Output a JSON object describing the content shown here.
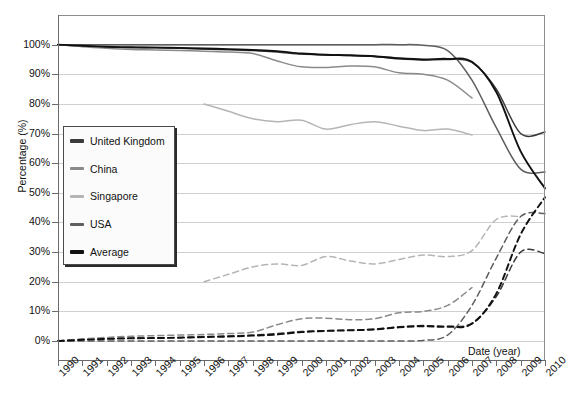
{
  "chart_title_cut_off": "",
  "axes": {
    "ylabel": "Percentage (%)",
    "xlabel": "Date (year)",
    "yticks": [
      "0%",
      "10%",
      "20%",
      "30%",
      "40%",
      "50%",
      "60%",
      "70%",
      "80%",
      "90%",
      "100%"
    ],
    "xticks": [
      "1990",
      "1991",
      "1992",
      "1993",
      "1994",
      "1995",
      "1996",
      "1997",
      "1998",
      "1999",
      "2000",
      "2001",
      "2002",
      "2003",
      "2004",
      "2005",
      "2006",
      "2007",
      "2008",
      "2009",
      "2010"
    ]
  },
  "legend": {
    "items": [
      {
        "label": "United Kingdom",
        "color": "#3a3a3a"
      },
      {
        "label": "China",
        "color": "#8a8a8a"
      },
      {
        "label": "Singapore",
        "color": "#b5b5b5"
      },
      {
        "label": "USA",
        "color": "#5e5e5e"
      },
      {
        "label": "Average",
        "color": "#111111"
      }
    ]
  },
  "chart_data": {
    "type": "line",
    "title": "",
    "xlabel": "Date (year)",
    "ylabel": "Percentage (%)",
    "xlim": [
      1990,
      2010
    ],
    "ylim": [
      0,
      110
    ],
    "grid": true,
    "legend_position": "inside-left",
    "x": [
      1990,
      1991,
      1992,
      1993,
      1994,
      1995,
      1996,
      1997,
      1998,
      1999,
      2000,
      2001,
      2002,
      2003,
      2004,
      2005,
      2006,
      2007,
      2008,
      2009,
      2010
    ],
    "series": [
      {
        "name": "United Kingdom",
        "style": "solid",
        "color": "#3a3a3a",
        "values": [
          100,
          99.5,
          99.2,
          99.0,
          99.0,
          98.8,
          98.5,
          98.3,
          98.0,
          97.5,
          96.8,
          96.5,
          96.3,
          96.0,
          95.2,
          94.8,
          95.0,
          94.0,
          85.0,
          70.0,
          70.5
        ]
      },
      {
        "name": "China",
        "style": "solid",
        "color": "#8a8a8a",
        "values": [
          100,
          99.3,
          98.8,
          98.4,
          98.2,
          98.0,
          97.8,
          97.5,
          97.0,
          94.5,
          92.5,
          92.3,
          92.8,
          92.5,
          90.5,
          90.0,
          88.0,
          82.0,
          null,
          null,
          null
        ]
      },
      {
        "name": "Singapore",
        "style": "solid",
        "color": "#b5b5b5",
        "values": [
          null,
          null,
          null,
          null,
          null,
          null,
          80.0,
          77.5,
          75.0,
          74.0,
          74.5,
          71.5,
          73.0,
          74.0,
          72.5,
          71.0,
          71.5,
          69.5,
          null,
          null,
          null
        ]
      },
      {
        "name": "USA",
        "style": "solid",
        "color": "#5e5e5e",
        "values": [
          100,
          100,
          100,
          100,
          100,
          100,
          100,
          100,
          100,
          100,
          100,
          100,
          100,
          100,
          100,
          99.8,
          98.0,
          88.0,
          72.0,
          58.0,
          57.0
        ]
      },
      {
        "name": "Average",
        "style": "solid",
        "color": "#111111",
        "values": [
          100,
          99.6,
          99.3,
          99.1,
          99.0,
          98.9,
          98.7,
          98.5,
          98.2,
          97.8,
          97.0,
          96.6,
          96.4,
          96.1,
          95.4,
          95.0,
          95.2,
          94.2,
          84.0,
          64.0,
          51.5
        ]
      },
      {
        "name": "United Kingdom (complement)",
        "style": "dashed",
        "color": "#3a3a3a",
        "values": [
          0,
          0.5,
          0.8,
          1.0,
          1.0,
          1.2,
          1.5,
          1.7,
          2.0,
          2.5,
          3.2,
          3.5,
          3.7,
          4.0,
          4.8,
          5.2,
          5.0,
          6.0,
          15.0,
          30.0,
          29.5
        ]
      },
      {
        "name": "China (complement)",
        "style": "dashed",
        "color": "#8a8a8a",
        "values": [
          0,
          0.7,
          1.2,
          1.6,
          1.8,
          2.0,
          2.2,
          2.5,
          3.0,
          5.5,
          7.5,
          7.7,
          7.2,
          7.5,
          9.5,
          10.0,
          12.0,
          18.0,
          null,
          null,
          null
        ]
      },
      {
        "name": "Singapore (complement)",
        "style": "dashed",
        "color": "#b5b5b5",
        "values": [
          null,
          null,
          null,
          null,
          null,
          null,
          20.0,
          22.5,
          25.0,
          26.0,
          25.5,
          28.5,
          27.0,
          26.0,
          27.5,
          29.0,
          28.5,
          30.5,
          41.0,
          42.0,
          null
        ]
      },
      {
        "name": "USA (complement)",
        "style": "dashed",
        "color": "#5e5e5e",
        "values": [
          0,
          0,
          0,
          0,
          0,
          0,
          0,
          0,
          0,
          0,
          0,
          0,
          0,
          0,
          0,
          0.2,
          2.0,
          12.0,
          28.0,
          42.0,
          43.0
        ]
      },
      {
        "name": "Average (complement)",
        "style": "dashed",
        "color": "#111111",
        "values": [
          0,
          0.4,
          0.7,
          0.9,
          1.0,
          1.1,
          1.3,
          1.5,
          1.8,
          2.2,
          3.0,
          3.4,
          3.6,
          3.9,
          4.6,
          5.0,
          4.8,
          5.8,
          16.0,
          36.0,
          48.5
        ]
      }
    ]
  }
}
